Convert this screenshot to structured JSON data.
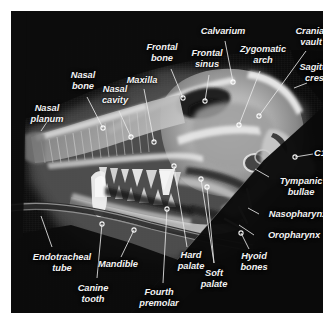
{
  "figure": {
    "kind": "annotated-lateral-radiograph",
    "background_color": "#0b0b0b",
    "page_color": "#ffffff",
    "label_color": "#f2f2f2"
  },
  "labels": [
    {
      "id": "nasal-planum",
      "text": "Nasal\nplanum",
      "line1": "Nasal",
      "line2": "planum",
      "x": 36,
      "y": 97,
      "align": "c"
    },
    {
      "id": "nasal-bone",
      "text": "Nasal\nbone",
      "line1": "Nasal",
      "line2": "bone",
      "x": 72,
      "y": 64,
      "align": "c"
    },
    {
      "id": "nasal-cavity",
      "text": "Nasal\ncavity",
      "line1": "Nasal",
      "line2": "cavity",
      "x": 104,
      "y": 78,
      "align": "c"
    },
    {
      "id": "maxilla",
      "text": "Maxilla",
      "line1": "Maxilla",
      "line2": "",
      "x": 131,
      "y": 68,
      "align": "c"
    },
    {
      "id": "frontal-bone",
      "text": "Frontal\nbone",
      "line1": "Frontal",
      "line2": "bone",
      "x": 151,
      "y": 36,
      "align": "c"
    },
    {
      "id": "frontal-sinus",
      "text": "Frontal\nsinus",
      "line1": "Frontal",
      "line2": "sinus",
      "x": 196,
      "y": 42,
      "align": "c"
    },
    {
      "id": "calvarium",
      "text": "Calvarium",
      "line1": "Calvarium",
      "line2": "",
      "x": 212,
      "y": 20,
      "align": "c"
    },
    {
      "id": "zygomatic-arch",
      "text": "Zygomatic\narch",
      "line1": "Zygomatic",
      "line2": "arch",
      "x": 252,
      "y": 38,
      "align": "c"
    },
    {
      "id": "cranial-vault",
      "text": "Cranial\nvault",
      "line1": "Cranial",
      "line2": "vault",
      "x": 300,
      "y": 20,
      "align": "c"
    },
    {
      "id": "sagittal-crest",
      "text": "Sagittal\ncrest",
      "line1": "Sagittal",
      "line2": "crest",
      "x": 305,
      "y": 56,
      "align": "c"
    },
    {
      "id": "c1",
      "text": "C1",
      "line1": "C1",
      "line2": "",
      "x": 309,
      "y": 142,
      "align": "c"
    },
    {
      "id": "tympanic-bullae",
      "text": "Tympanic\nbullae",
      "line1": "Tympanic",
      "line2": "bullae",
      "x": 290,
      "y": 170,
      "align": "c"
    },
    {
      "id": "nasopharynx",
      "text": "Nasopharynx",
      "line1": "Nasopharynx",
      "line2": "",
      "x": 287,
      "y": 203,
      "align": "c"
    },
    {
      "id": "oropharynx",
      "text": "Oropharynx",
      "line1": "Oropharynx",
      "line2": "",
      "x": 283,
      "y": 224,
      "align": "c"
    },
    {
      "id": "hyoid-bones",
      "text": "Hyoid\nbones",
      "line1": "Hyoid",
      "line2": "bones",
      "x": 243,
      "y": 245,
      "align": "c"
    },
    {
      "id": "soft-palate",
      "text": "Soft\npalate",
      "line1": "Soft",
      "line2": "palate",
      "x": 203,
      "y": 262,
      "align": "c"
    },
    {
      "id": "hard-palate",
      "text": "Hard\npalate",
      "line1": "Hard",
      "line2": "palate",
      "x": 180,
      "y": 244,
      "align": "c"
    },
    {
      "id": "fourth-premolar",
      "text": "Fourth\npremolar",
      "line1": "Fourth",
      "line2": "premolar",
      "x": 148,
      "y": 281,
      "align": "c"
    },
    {
      "id": "mandible",
      "text": "Mandible",
      "line1": "Mandible",
      "line2": "",
      "x": 107,
      "y": 253,
      "align": "c"
    },
    {
      "id": "canine-tooth",
      "text": "Canine\ntooth",
      "line1": "Canine",
      "line2": "tooth",
      "x": 82,
      "y": 277,
      "align": "c"
    },
    {
      "id": "endotracheal-tube",
      "text": "Endotracheal\ntube",
      "line1": "Endotracheal",
      "line2": "tube",
      "x": 51,
      "y": 246,
      "align": "c"
    }
  ],
  "leaders": [
    {
      "id": "nasal-planum",
      "path": "M 38 108 L 30 120",
      "dot": null
    },
    {
      "id": "nasal-bone",
      "path": "M 76 86 L 92 117",
      "dot": [
        92,
        117
      ]
    },
    {
      "id": "nasal-cavity",
      "path": "M 108 100 L 120 126",
      "dot": [
        120,
        126
      ]
    },
    {
      "id": "maxilla",
      "path": "M 133 78 L 143 131",
      "dot": [
        143,
        131
      ]
    },
    {
      "id": "frontal-bone",
      "path": "M 160 58 L 172 87",
      "dot": null
    },
    {
      "id": "frontal-sinus",
      "path": "M 198 64 L 194 90",
      "dot": null
    },
    {
      "id": "calvarium",
      "path": "M 214 30 L 222 71",
      "dot": null
    },
    {
      "id": "zygomatic-arch",
      "path": "M 249 60 L 228 114",
      "dot": [
        228,
        114
      ]
    },
    {
      "id": "cranial-vault",
      "path": "M 295 40 L 248 105",
      "dot": [
        248,
        105
      ]
    },
    {
      "id": "sagittal-crest",
      "path": "M 296 72 L 283 77",
      "dot": null
    },
    {
      "id": "c1",
      "path": "M 302 143 L 284 146",
      "dot": [
        284,
        146
      ]
    },
    {
      "id": "hyoid-bones",
      "path": "M 238 238 L 230 222",
      "dot": [
        230,
        222
      ]
    },
    {
      "id": "soft-palate",
      "path": "M 203 252 L 196 176",
      "dot": [
        196,
        176
      ]
    },
    {
      "id": "soft-palate-2",
      "path": "M 203 252 L 190 168",
      "dot": [
        190,
        168
      ]
    },
    {
      "id": "hard-palate",
      "path": "M 176 236 L 163 155",
      "dot": [
        163,
        155
      ]
    },
    {
      "id": "fourth-premolar",
      "path": "M 152 272 L 156 198",
      "dot": [
        156,
        198
      ]
    },
    {
      "id": "mandible",
      "path": "M 110 246 L 123 219",
      "dot": [
        123,
        219
      ]
    },
    {
      "id": "canine-tooth",
      "path": "M 86 267 L 91 213",
      "dot": [
        91,
        213
      ]
    },
    {
      "id": "endotracheal-tube",
      "path": "M 41 236 L 30 205",
      "dot": null
    },
    {
      "id": "nasopharynx",
      "path": "M 248 203 L 237 197",
      "dot": null
    },
    {
      "id": "oropharynx",
      "path": "M 243 224 L 228 214",
      "dot": null
    },
    {
      "id": "tympanic-bullae",
      "path": "M 258 166 L 244 158",
      "dot": null
    }
  ]
}
